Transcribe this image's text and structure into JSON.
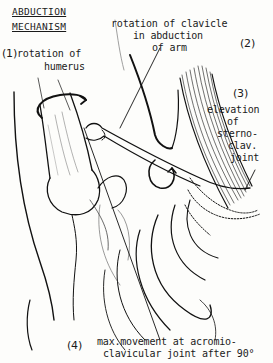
{
  "title": {
    "line1": "ABDUCTION",
    "line2": "MECHANISM"
  },
  "labels": [
    {
      "number": "(1)",
      "line1": "rotation of",
      "line2": "humerus"
    },
    {
      "number": "(2)",
      "line1": "rotation of clavicle",
      "line2": "in abduction",
      "line3": "of arm"
    },
    {
      "number": "(3)",
      "line1": "elevation",
      "line2": "of",
      "line3": "sterno-",
      "line4": "clav.",
      "line5": "joint"
    },
    {
      "number": "(4)",
      "line1": "max.movement at acromio-",
      "line2": "clavicular joint after 90°"
    }
  ],
  "illustration": {
    "subject": "shoulder girdle anatomy: humerus, clavicle, scapula, ribs, sternocleidomastoid muscle",
    "line_color": "#111111",
    "background": "#fdfdfb"
  }
}
